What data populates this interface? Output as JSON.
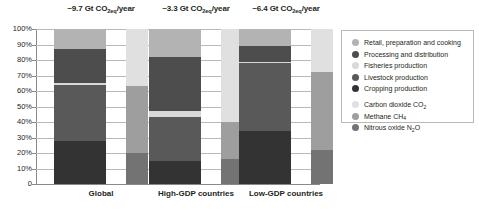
{
  "chart_data": {
    "type": "bar",
    "title": "",
    "xlabel": "",
    "ylabel": "",
    "ylim": [
      0,
      100
    ],
    "grid": true,
    "stacked": true,
    "normalized_percent": true,
    "legend_position": "right",
    "y_ticks": [
      "100%",
      "90%",
      "80%",
      "70%",
      "60%",
      "50%",
      "40%",
      "30%",
      "20%",
      "10%",
      "0"
    ],
    "y_tick_values": [
      100,
      90,
      80,
      70,
      60,
      50,
      40,
      30,
      20,
      10,
      0
    ],
    "categories": [
      "Global",
      "High-GDP countries",
      "Low-GDP countries"
    ],
    "group_titles": [
      "~9.7 Gt CO2eq/year",
      "~3.3 Gt CO2eq/year",
      "~6.4 Gt CO2eq/year"
    ],
    "group_title_parts": [
      {
        "pre": "~9.7 Gt CO",
        "sub": "2eq",
        "post": "/year"
      },
      {
        "pre": "~3.3 Gt CO",
        "sub": "2eq",
        "post": "/year"
      },
      {
        "pre": "~6.4 Gt CO",
        "sub": "2eq",
        "post": "/year"
      }
    ],
    "series_sector": [
      {
        "name": "Retail, preparation and cooking",
        "color": "#b3b3b3",
        "values": [
          13,
          18,
          11
        ]
      },
      {
        "name": "Processing and distribution",
        "color": "#4d4d4d",
        "values": [
          22,
          35,
          10
        ]
      },
      {
        "name": "Fisheries production",
        "color": "#d9d9d9",
        "values": [
          1,
          4,
          1
        ]
      },
      {
        "name": "Livestock production",
        "color": "#595959",
        "values": [
          36,
          28,
          44
        ]
      },
      {
        "name": "Cropping production",
        "color": "#333333",
        "values": [
          28,
          15,
          34
        ]
      }
    ],
    "series_gas": [
      {
        "name": "Carbon dioxide CO2",
        "color": "#e0e0e0",
        "values": [
          37,
          60,
          28
        ]
      },
      {
        "name": "Methane CH4",
        "color": "#9e9e9e",
        "values": [
          43,
          24,
          50
        ]
      },
      {
        "name": "Nitrous oxide N2O",
        "color": "#737373",
        "values": [
          20,
          16,
          22
        ]
      }
    ]
  },
  "legend": {
    "sector_items": [
      {
        "label": "Retail, preparation and cooking",
        "color": "#b3b3b3"
      },
      {
        "label": "Processing and distribution",
        "color": "#4d4d4d"
      },
      {
        "label": "Fisheries production",
        "color": "#d9d9d9"
      },
      {
        "label": "Livestock production",
        "color": "#595959"
      },
      {
        "label": "Cropping production",
        "color": "#333333"
      }
    ],
    "gas_items": [
      {
        "pre": "Carbon dioxide CO",
        "sub": "2",
        "post": "",
        "color": "#e0e0e0"
      },
      {
        "pre": "Methane CH",
        "sub": "4",
        "post": "",
        "color": "#9e9e9e"
      },
      {
        "pre": "Nitrous oxide N",
        "sub": "2",
        "post": "O",
        "color": "#737373"
      }
    ]
  }
}
